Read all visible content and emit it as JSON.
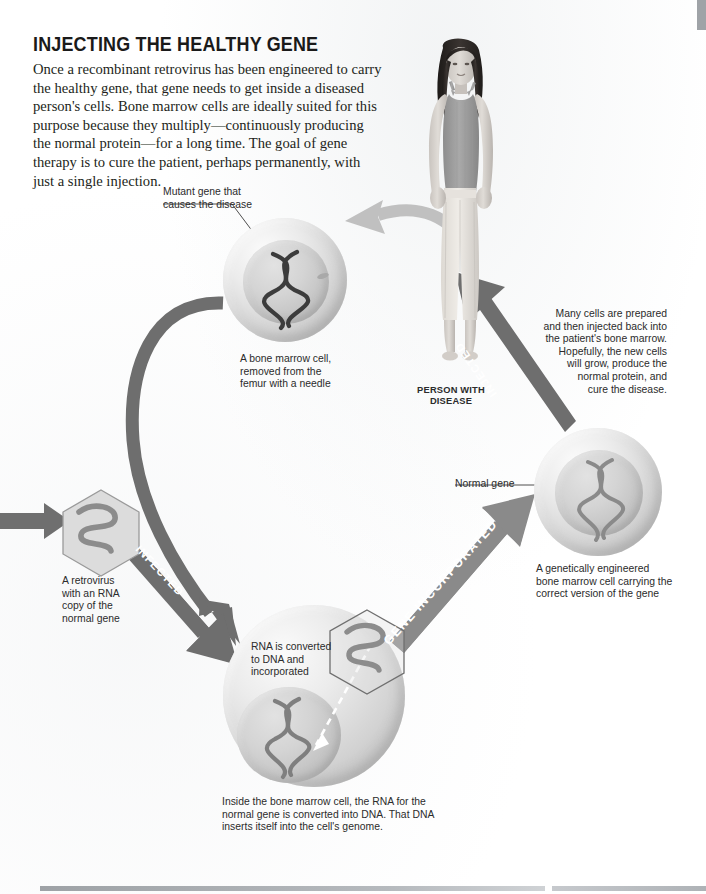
{
  "page": {
    "headline": "INJECTING THE HEALTHY GENE",
    "intro": "Once a recombinant retrovirus has been engineered to carry the healthy gene, that gene needs to get inside a diseased person's cells. Bone marrow cells are ideally suited for this purpose because they multiply—continuously producing the normal protein—for a long time. The goal of gene therapy is to cure the patient, perhaps permanently, with just a single injection."
  },
  "labels": {
    "mutant_gene": "Mutant gene that\ncauses the disease",
    "bone_marrow_cell": "A bone marrow cell,\nremoved from the\nfemur with a needle",
    "person_with_disease": "PERSON WITH\nDISEASE",
    "many_cells": "Many cells are prepared\nand then injected back into\nthe patient's bone marrow.\nHopefully, the new cells\nwill grow, produce the\nnormal protein, and\ncure the disease.",
    "retrovirus": "A retrovirus\nwith an RNA\ncopy of the\nnormal gene",
    "rna_converted": "RNA is converted\nto DNA and\nincorporated",
    "inside_cell": "Inside the bone marrow cell, the RNA for the\nnormal gene is converted into DNA. That DNA\ninserts itself into the cell's genome.",
    "normal_gene": "Normal gene",
    "engineered_cell": "A genetically engineered\nbone marrow cell carrying the\ncorrect version of the gene"
  },
  "arrows": {
    "infected": "INFECTED",
    "gene_incorporated": "GENE INCORPORATED",
    "injected": "INJECTED"
  },
  "colors": {
    "arrow_dark": "#6e6e6e",
    "arrow_light": "#c2c2c2",
    "cell_fill": "#d4d4d4",
    "dna_dark": "#3a3a3a",
    "dna_mid": "#7d7d7d",
    "text": "#231f20",
    "rule": "#b9bcc0"
  }
}
